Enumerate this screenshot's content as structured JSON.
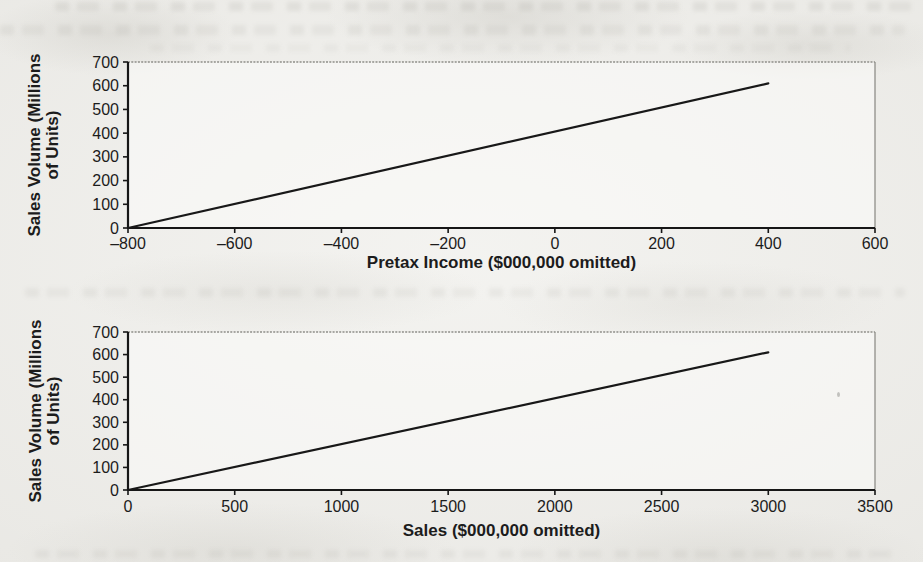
{
  "page": {
    "kind": "scanned-book-page",
    "paper_color": "#e9e8e4",
    "ink_color": "#1c1c1c",
    "axis_color": "#161616",
    "border_color": "#8f8e89",
    "line_color": "#181818"
  },
  "chart_data": [
    {
      "type": "line",
      "name": "pretax-income-vs-volume",
      "xlabel": "Pretax Income ($000,000 omitted)",
      "ylabel": "Sales Volume (Millions of Units)",
      "ylabel_lines": [
        "Sales Volume (Millions",
        "of Units)"
      ],
      "xlim": [
        -800,
        600
      ],
      "ylim": [
        0,
        700
      ],
      "xticks": [
        -800,
        -600,
        -400,
        -200,
        0,
        200,
        400,
        600
      ],
      "xtick_labels": [
        "–800",
        "–600",
        "–400",
        "–200",
        "0",
        "200",
        "400",
        "600"
      ],
      "yticks": [
        0,
        100,
        200,
        300,
        400,
        500,
        600,
        700
      ],
      "ytick_labels": [
        "0",
        "100",
        "200",
        "300",
        "400",
        "500",
        "600",
        "700"
      ],
      "grid": false,
      "legend": "none",
      "series": [
        {
          "points": [
            [
              -800,
              0
            ],
            [
              400,
              610
            ]
          ]
        }
      ]
    },
    {
      "type": "line",
      "name": "sales-vs-volume",
      "xlabel": "Sales ($000,000 omitted)",
      "ylabel": "Sales Volume (Millions of Units)",
      "ylabel_lines": [
        "Sales Volume (Millions",
        "of Units)"
      ],
      "xlim": [
        0,
        3500
      ],
      "ylim": [
        0,
        700
      ],
      "xticks": [
        0,
        500,
        1000,
        1500,
        2000,
        2500,
        3000,
        3500
      ],
      "xtick_labels": [
        "0",
        "500",
        "1000",
        "1500",
        "2000",
        "2500",
        "3000",
        "3500"
      ],
      "yticks": [
        0,
        100,
        200,
        300,
        400,
        500,
        600,
        700
      ],
      "ytick_labels": [
        "0",
        "100",
        "200",
        "300",
        "400",
        "500",
        "600",
        "700"
      ],
      "grid": false,
      "legend": "none",
      "series": [
        {
          "points": [
            [
              0,
              0
            ],
            [
              3000,
              610
            ]
          ]
        }
      ]
    }
  ]
}
